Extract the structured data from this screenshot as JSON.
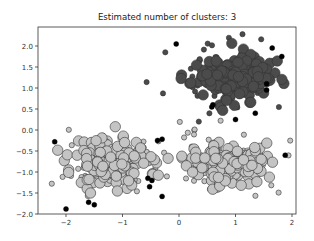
{
  "chart_data": {
    "type": "scatter",
    "title": "Estimated number of clusters: 3",
    "xlabel": "",
    "ylabel": "",
    "xlim": [
      -2.5,
      2.1
    ],
    "ylim": [
      -2.0,
      2.4
    ],
    "grid": false,
    "legend": null,
    "x_ticks": [
      -2,
      -1,
      0,
      1,
      2
    ],
    "x_tick_labels": [
      "−2",
      "−1",
      "0",
      "1",
      "2"
    ],
    "y_ticks": [
      2.0,
      1.5,
      1.0,
      0.5,
      0.0,
      -0.5,
      -1.0,
      -1.5,
      -2.0
    ],
    "y_tick_labels": [
      "2.0",
      "1.5",
      "1.0",
      "0.5",
      "0.0",
      "−0.5",
      "−1.0",
      "−1.5",
      "−2.0"
    ],
    "clusters": [
      {
        "name": "cluster-0",
        "color": "#c4c4c4",
        "center": [
          -1.2,
          -0.75
        ],
        "spread": [
          0.42,
          0.38
        ],
        "core_points": 170,
        "border_points": 45,
        "seed": 11
      },
      {
        "name": "cluster-1",
        "color": "#4b4b4b",
        "center": [
          0.95,
          1.25
        ],
        "spread": [
          0.45,
          0.33
        ],
        "core_points": 170,
        "border_points": 40,
        "seed": 23
      },
      {
        "name": "cluster-2",
        "color": "#c4c4c4",
        "center": [
          0.85,
          -0.78
        ],
        "spread": [
          0.42,
          0.33
        ],
        "core_points": 160,
        "border_points": 40,
        "seed": 37
      }
    ],
    "noise": {
      "color": "#000000",
      "points": [
        [
          -0.05,
          2.05
        ],
        [
          1.65,
          1.95
        ],
        [
          -2.2,
          -0.28
        ],
        [
          -0.3,
          -0.22
        ],
        [
          -0.55,
          -1.15
        ],
        [
          -0.48,
          -1.2
        ],
        [
          -0.52,
          -1.35
        ],
        [
          -0.3,
          -1.58
        ],
        [
          -1.6,
          -1.72
        ],
        [
          -1.5,
          -1.78
        ],
        [
          -2.0,
          -1.88
        ],
        [
          0.58,
          0.55
        ],
        [
          0.6,
          0.6
        ],
        [
          1.35,
          0.4
        ],
        [
          1.0,
          0.25
        ],
        [
          1.55,
          1.1
        ],
        [
          1.55,
          0.95
        ],
        [
          1.82,
          1.75
        ],
        [
          1.88,
          -0.6
        ],
        [
          -0.38,
          -0.25
        ]
      ]
    },
    "marker_sizes": {
      "core_radius": 5.2,
      "border_radius": 2.6,
      "noise_radius": 2.5
    }
  },
  "layout": {
    "plot_left": 38,
    "plot_right": 296,
    "plot_top": 27,
    "plot_bottom": 214
  }
}
